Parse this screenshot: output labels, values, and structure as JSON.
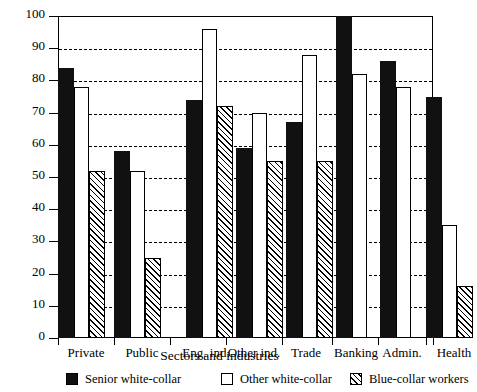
{
  "chart_data": {
    "type": "bar",
    "title": "",
    "xlabel": "Sectors and industries",
    "ylabel": "",
    "ylim": [
      0,
      100
    ],
    "yticks": [
      0,
      10,
      20,
      30,
      40,
      50,
      60,
      70,
      80,
      90,
      100
    ],
    "grid": true,
    "legend_position": "bottom",
    "categories": [
      "Private",
      "Public",
      "Eng. ind.",
      "Other ind.",
      "Trade",
      "Banking",
      "Admin.",
      "Health"
    ],
    "series": [
      {
        "name": "Senior white-collar",
        "values": [
          84,
          58,
          74,
          59,
          67,
          100,
          86,
          75
        ]
      },
      {
        "name": "Other white-collar",
        "values": [
          78,
          52,
          96,
          70,
          88,
          82,
          78,
          35
        ]
      },
      {
        "name": "Blue-collar workers",
        "values": [
          52,
          25,
          72,
          55,
          55,
          null,
          null,
          16
        ]
      }
    ]
  },
  "axis": {
    "y_tick_labels": [
      "0",
      "10",
      "20",
      "30",
      "40",
      "50",
      "60",
      "70",
      "80",
      "90",
      "100"
    ],
    "x_tick_labels": [
      "Private",
      "Public",
      "Eng. ind.",
      "Other ind.",
      "Trade",
      "Banking",
      "Admin.",
      "Health"
    ],
    "x_title": "Sectors and industries"
  },
  "legend": {
    "items": [
      {
        "label": "Senior white-collar",
        "swatch": "solid-black-square-icon"
      },
      {
        "label": "Other white-collar",
        "swatch": "open-white-square-icon"
      },
      {
        "label": "Blue-collar workers",
        "swatch": "hatched-square-icon"
      }
    ]
  },
  "colors": {
    "bar_fill": "#111111",
    "outline": "#000000",
    "background": "#ffffff"
  }
}
